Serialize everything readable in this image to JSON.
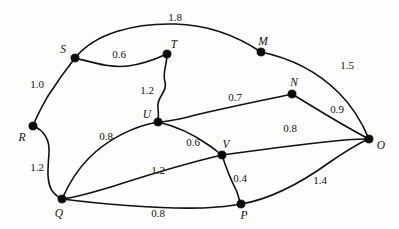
{
  "figure": {
    "background_color": "#fdfdfc",
    "stroke_color": "#111111"
  },
  "nodes": [
    {
      "id": "S",
      "label": "S",
      "cx": 75,
      "cy": 58,
      "lx": 63,
      "ly": 50
    },
    {
      "id": "T",
      "label": "T",
      "cx": 167,
      "cy": 54,
      "lx": 174,
      "ly": 45
    },
    {
      "id": "M",
      "label": "M",
      "cx": 261,
      "cy": 52,
      "lx": 263,
      "ly": 42
    },
    {
      "id": "N",
      "label": "N",
      "cx": 292,
      "cy": 94,
      "lx": 294,
      "ly": 83
    },
    {
      "id": "O",
      "label": "O",
      "cx": 369,
      "cy": 139,
      "lx": 381,
      "ly": 146
    },
    {
      "id": "R",
      "label": "R",
      "cx": 33,
      "cy": 126,
      "lx": 22,
      "ly": 138
    },
    {
      "id": "U",
      "label": "U",
      "cx": 158,
      "cy": 122,
      "lx": 147,
      "ly": 115
    },
    {
      "id": "V",
      "label": "V",
      "cx": 222,
      "cy": 155,
      "lx": 226,
      "ly": 145
    },
    {
      "id": "Q",
      "label": "Q",
      "cx": 62,
      "cy": 199,
      "lx": 59,
      "ly": 214
    },
    {
      "id": "P",
      "label": "P",
      "cx": 241,
      "cy": 204,
      "lx": 244,
      "ly": 216
    }
  ],
  "edges": [
    {
      "from": "S",
      "to": "M",
      "weight": "1.8",
      "lx": 175,
      "ly": 17,
      "d": "M 75 58 C 95 33 135 23 175 24 C 215 25 243 40 261 52"
    },
    {
      "from": "S",
      "to": "T",
      "weight": "0.6",
      "lx": 119,
      "ly": 54,
      "d": "M 75 58 C 95 63 110 68 128 66 C 146 64 158 58 167 54"
    },
    {
      "from": "S",
      "to": "R",
      "weight": "1.0",
      "lx": 37,
      "ly": 84,
      "d": "M 75 58 C 64 72 55 85 48 96 C 43 105 38 113 33 126"
    },
    {
      "from": "T",
      "to": "U",
      "weight": "1.2",
      "lx": 147,
      "ly": 90,
      "d": "M 167 54 C 167 66 162 72 165 82 C 168 92 156 97 158 108 C 159 115 158 118 158 122"
    },
    {
      "from": "M",
      "to": "O",
      "weight": "1.5",
      "lx": 347,
      "ly": 65,
      "d": "M 261 52 C 290 58 318 72 339 93 C 355 109 364 127 369 139"
    },
    {
      "from": "N",
      "to": "U",
      "weight": "0.7",
      "lx": 235,
      "ly": 97,
      "d": "M 292 94 C 260 101 215 110 188 117 C 175 120 165 122 158 122"
    },
    {
      "from": "N",
      "to": "O",
      "weight": "0.9",
      "lx": 337,
      "ly": 109,
      "d": "M 292 94 C 312 106 340 124 369 139"
    },
    {
      "from": "R",
      "to": "Q",
      "weight": "1.2",
      "lx": 37,
      "ly": 167,
      "d": "M 33 126 C 44 130 50 140 49 153 C 48 168 46 183 53 192 C 57 197 60 198 62 199"
    },
    {
      "from": "U",
      "to": "Q",
      "weight": "0.8",
      "lx": 106,
      "ly": 136,
      "d": "M 158 122 C 134 126 108 139 89 158 C 74 173 66 190 62 199"
    },
    {
      "from": "U",
      "to": "V",
      "weight": "0.6",
      "lx": 193,
      "ly": 142,
      "d": "M 158 122 C 176 126 196 136 210 146 C 217 151 220 154 222 155"
    },
    {
      "from": "V",
      "to": "Q",
      "weight": "1.2",
      "lx": 158,
      "ly": 170,
      "d": "M 222 155 C 192 162 148 175 114 186 C 88 194 70 198 62 199"
    },
    {
      "from": "V",
      "to": "O",
      "weight": "0.8",
      "lx": 290,
      "ly": 128,
      "d": "M 222 155 C 259 150 313 143 345 140 C 359 139 366 139 369 139"
    },
    {
      "from": "V",
      "to": "P",
      "weight": "0.4",
      "lx": 240,
      "ly": 178,
      "d": "M 222 155 C 226 168 232 182 237 192 C 239 199 240 202 241 204"
    },
    {
      "from": "Q",
      "to": "P",
      "weight": "0.8",
      "lx": 158,
      "ly": 213,
      "d": "M 62 199 C 102 204 160 209 203 208 C 225 207 236 205 241 204"
    },
    {
      "from": "P",
      "to": "O",
      "weight": "1.4",
      "lx": 320,
      "ly": 180,
      "d": "M 241 204 C 272 199 305 180 330 162 C 352 147 364 141 369 139"
    }
  ]
}
